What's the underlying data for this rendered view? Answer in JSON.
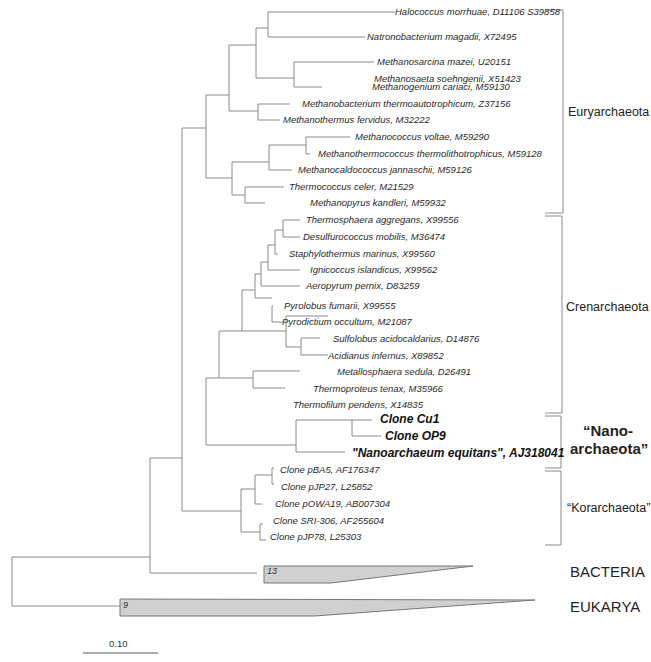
{
  "figure": {
    "type": "phylogenetic-tree",
    "scale_bar": {
      "label": "0.10"
    },
    "clades": {
      "euryarchaeota": "Euryarchaeota",
      "crenarchaeota": "Crenarchaeota",
      "nanoarchaeota_line1": "“Nano-",
      "nanoarchaeota_line2": "archaeota”",
      "korarchaeota": "“Korarchaeota”"
    },
    "domains": {
      "bacteria": {
        "label": "BACTERIA",
        "collapsed_count": "13"
      },
      "eukarya": {
        "label": "EUKARYA",
        "collapsed_count": "9"
      }
    },
    "leaves": [
      "Halococcus morrhuae, D11106 S39858",
      "Natronobacterium magadii, X72495",
      "Methanosarcina mazei, U20151",
      "Methanosaeta soehngenii, X51423",
      "Methanogenium cariaci, M59130",
      "Methanobacterium thermoautotrophicum, Z37156",
      "Methanothermus fervidus, M32222",
      "Methanococcus voltae, M59290",
      "Methanothermococcus thermolithotrophicus, M59128",
      "Methanocaldococcus jannaschii, M59126",
      "Thermococcus celer, M21529",
      "Methanopyrus kandleri, M59932",
      "Thermosphaera aggregans, X99556",
      "Desulfurococcus mobilis, M36474",
      "Staphylothermus marinus, X99560",
      "Ignicoccus islandicus, X99562",
      "Aeropyrum pernix, D83259",
      "Pyrolobus fumarii, X99555",
      "Pyrodictium occultum, M21087",
      "Sulfolobus acidocaldarius, D14876",
      "Acidianus infernus, X89852",
      "Metallosphaera sedula, D26491",
      "Thermoproteus tenax, M35966",
      "Thermofilum pendens, X14835",
      "Clone Cu1",
      "Clone OP9",
      "\"Nanoarchaeum equitans\", AJ318041",
      "Clone pBA5, AF176347",
      "Clone pJP27, L25852",
      "Clone pOWA19, AB007304",
      "Clone SRI-306, AF255604",
      "Clone pJP78, L25303"
    ]
  }
}
